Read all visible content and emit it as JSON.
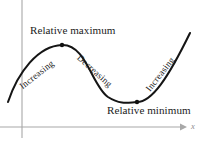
{
  "figure": {
    "background_color": "#ffffff",
    "width": 201,
    "height": 143
  },
  "axes": {
    "x_axis_label": "x",
    "axis_color": "#a8a8a8",
    "x_axis_y": 127,
    "y_axis_x": 22,
    "x_axis_arrow_tip_x": 186
  },
  "curve": {
    "color": "#151515",
    "stroke_width": 2.05
  },
  "labels": {
    "relative_maximum": "Relative maximum",
    "relative_minimum": "Relative minimum",
    "increasing_left": "Increasing",
    "decreasing": "Decreasing",
    "increasing_right": "Increasing"
  },
  "chart_data": {
    "type": "line",
    "title": "",
    "xlabel": "x",
    "ylabel": "",
    "grid": false,
    "legend": "none",
    "annotations": [
      {
        "text": "Relative maximum",
        "x": 62,
        "y": 45,
        "position": "above"
      },
      {
        "text": "Relative minimum",
        "x": 137,
        "y": 102,
        "position": "below"
      },
      {
        "text": "Increasing",
        "rotation": -38,
        "interval": "left-rising"
      },
      {
        "text": "Decreasing",
        "rotation": 42,
        "interval": "middle-falling"
      },
      {
        "text": "Increasing",
        "rotation": -52,
        "interval": "right-rising"
      }
    ],
    "points": [
      {
        "name": "curve-start",
        "x": 8,
        "y": 102
      },
      {
        "name": "relative-maximum",
        "x": 62,
        "y": 45,
        "marker": true
      },
      {
        "name": "inflection",
        "x": 100,
        "y": 74
      },
      {
        "name": "relative-minimum",
        "x": 137,
        "y": 102,
        "marker": true
      },
      {
        "name": "curve-end",
        "x": 190,
        "y": 33
      }
    ],
    "path": "M 8,102 C 18,72 38,46 62,45 C 86,44 92,86 108,97 C 122,106 130,102 137,102 C 152,102 168,78 190,33"
  }
}
